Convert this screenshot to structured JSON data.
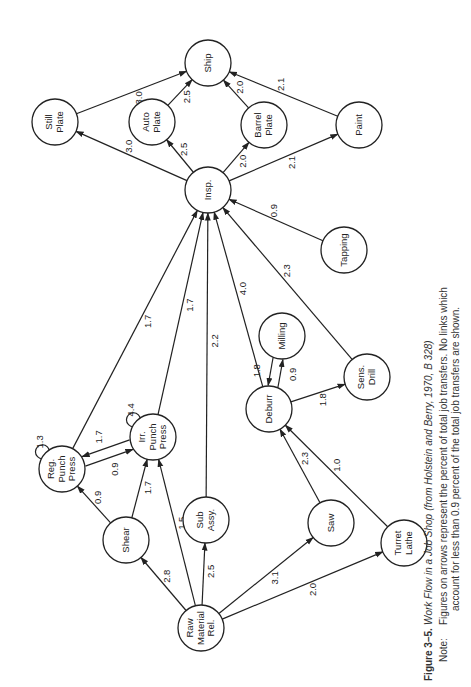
{
  "figure": {
    "number": "Figure 3–5.",
    "title_prefix": "Work Flow in a Job Shop",
    "title_source": "(from Holstein and Berry, 1970, B 328)",
    "note_label": "Note:",
    "note_line1": "Figures on arrows represent the percent of total job transfers. No links which",
    "note_line2": "account for less than 0.9 percent of the total job transfers are shown."
  },
  "nodes": [
    {
      "id": "ship",
      "lines": [
        "Ship"
      ],
      "x": 208,
      "y": 63
    },
    {
      "id": "still-plate",
      "lines": [
        "Still",
        "Plate"
      ],
      "x": 55,
      "y": 122
    },
    {
      "id": "auto-plate",
      "lines": [
        "Auto",
        "Plate"
      ],
      "x": 152,
      "y": 122
    },
    {
      "id": "barrel-plate",
      "lines": [
        "Barrel",
        "Plate"
      ],
      "x": 264,
      "y": 125
    },
    {
      "id": "paint",
      "lines": [
        "Paint"
      ],
      "x": 359,
      "y": 125
    },
    {
      "id": "insp",
      "lines": [
        "Insp."
      ],
      "x": 208,
      "y": 190
    },
    {
      "id": "tapping",
      "lines": [
        "Tapping"
      ],
      "x": 344,
      "y": 250
    },
    {
      "id": "milling",
      "lines": [
        "Milling"
      ],
      "x": 282,
      "y": 336
    },
    {
      "id": "deburr",
      "lines": [
        "Deburr"
      ],
      "x": 269,
      "y": 409
    },
    {
      "id": "sens-drill",
      "lines": [
        "Sens.",
        "Drill"
      ],
      "x": 367,
      "y": 377
    },
    {
      "id": "reg-punch-press",
      "lines": [
        "Reg.",
        "Punch",
        "Press"
      ],
      "x": 62,
      "y": 469
    },
    {
      "id": "irr-punch-press",
      "lines": [
        "Irr.",
        "Punch",
        "Press"
      ],
      "x": 153,
      "y": 437
    },
    {
      "id": "sub-assy",
      "lines": [
        "Sub",
        "Assy."
      ],
      "x": 206,
      "y": 520
    },
    {
      "id": "shear",
      "lines": [
        "Shear"
      ],
      "x": 126,
      "y": 540
    },
    {
      "id": "saw",
      "lines": [
        "Saw"
      ],
      "x": 331,
      "y": 523
    },
    {
      "id": "turret-lathe",
      "lines": [
        "Turret",
        "Lathe"
      ],
      "x": 404,
      "y": 543
    },
    {
      "id": "raw-material-rel",
      "lines": [
        "Raw",
        "Material",
        "Rel."
      ],
      "x": 201,
      "y": 628
    }
  ],
  "edges": [
    {
      "from": "still-plate",
      "to": "ship",
      "label": "3.0"
    },
    {
      "from": "auto-plate",
      "to": "ship",
      "label": "2.5"
    },
    {
      "from": "barrel-plate",
      "to": "ship",
      "label": "2.0"
    },
    {
      "from": "paint",
      "to": "ship",
      "label": "2.1"
    },
    {
      "from": "insp",
      "to": "still-plate",
      "label": "3.0"
    },
    {
      "from": "insp",
      "to": "auto-plate",
      "label": "2.5"
    },
    {
      "from": "insp",
      "to": "barrel-plate",
      "label": "2.0"
    },
    {
      "from": "insp",
      "to": "paint",
      "label": "2.1"
    },
    {
      "from": "tapping",
      "to": "insp",
      "label": "0.9"
    },
    {
      "from": "sens-drill",
      "to": "insp",
      "label": "2.3"
    },
    {
      "from": "deburr",
      "to": "insp",
      "label": "4.0"
    },
    {
      "from": "sub-assy",
      "to": "insp",
      "label": "2.2"
    },
    {
      "from": "irr-punch-press",
      "to": "insp",
      "label": "1.7"
    },
    {
      "from": "reg-punch-press",
      "to": "insp",
      "label": "1.7"
    },
    {
      "from": "deburr",
      "to": "milling",
      "label": "0.9"
    },
    {
      "from": "milling",
      "to": "deburr",
      "label": "1.8"
    },
    {
      "from": "deburr",
      "to": "sens-drill",
      "label": "1.8"
    },
    {
      "from": "saw",
      "to": "deburr",
      "label": "2.3"
    },
    {
      "from": "turret-lathe",
      "to": "deburr",
      "label": "1.0"
    },
    {
      "from": "reg-punch-press",
      "to": "irr-punch-press",
      "label": "0.9"
    },
    {
      "from": "irr-punch-press",
      "to": "reg-punch-press",
      "label": "1.7"
    },
    {
      "from": "reg-punch-press",
      "to": "reg-punch-press",
      "label": "1.3"
    },
    {
      "from": "irr-punch-press",
      "to": "irr-punch-press",
      "label": "4.4"
    },
    {
      "from": "shear",
      "to": "reg-punch-press",
      "label": "0.9"
    },
    {
      "from": "shear",
      "to": "irr-punch-press",
      "label": "1.7"
    },
    {
      "from": "raw-material-rel",
      "to": "irr-punch-press",
      "label": "1.5"
    },
    {
      "from": "raw-material-rel",
      "to": "shear",
      "label": "2.8"
    },
    {
      "from": "raw-material-rel",
      "to": "sub-assy",
      "label": "2.5"
    },
    {
      "from": "raw-material-rel",
      "to": "saw",
      "label": "3.1"
    },
    {
      "from": "raw-material-rel",
      "to": "turret-lathe",
      "label": "2.0"
    }
  ]
}
